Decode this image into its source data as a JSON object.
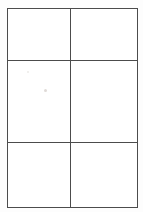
{
  "page": {
    "background_color": "#fdfdfd",
    "width": 143,
    "height": 212
  },
  "table": {
    "kind": "empty-grid",
    "columns": 2,
    "rows": 3,
    "border_color": "#4c4c4c",
    "border_width_px": 1,
    "cell_background": "#ffffff",
    "column_headers": [
      "",
      ""
    ],
    "cells": [
      [
        "",
        ""
      ],
      [
        "",
        ""
      ],
      [
        "",
        ""
      ]
    ]
  },
  "artifacts": {
    "speck_primary": "",
    "speck_secondary": ""
  }
}
